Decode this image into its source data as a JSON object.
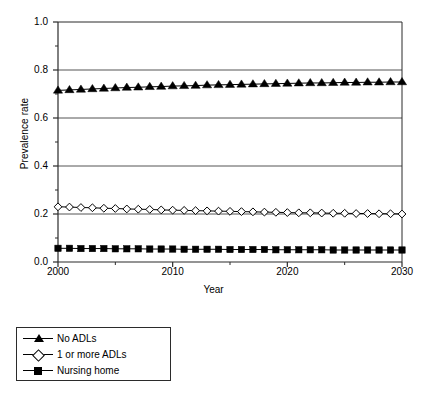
{
  "chart_data": {
    "type": "line",
    "title": "",
    "xlabel": "Year",
    "ylabel": "Prevalence rate",
    "xlim": [
      2000,
      2030
    ],
    "ylim": [
      0.0,
      1.0
    ],
    "grid": "horizontal-major",
    "legend_position": "below-left",
    "x_major_ticks": [
      2000,
      2010,
      2020,
      2030
    ],
    "x_tick_labels": [
      "2000",
      "2010",
      "2020",
      "2030"
    ],
    "x_minor_tick_interval": 5,
    "y_major_ticks": [
      0.0,
      0.2,
      0.4,
      0.6,
      0.8,
      1.0
    ],
    "y_tick_labels": [
      "0.0",
      "0.2",
      "0.4",
      "0.6",
      "0.8",
      "1.0"
    ],
    "y_minor_tick_interval": 0.1,
    "x": [
      2000,
      2001,
      2002,
      2003,
      2004,
      2005,
      2006,
      2007,
      2008,
      2009,
      2010,
      2011,
      2012,
      2013,
      2014,
      2015,
      2016,
      2017,
      2018,
      2019,
      2020,
      2021,
      2022,
      2023,
      2024,
      2025,
      2026,
      2027,
      2028,
      2029,
      2030
    ],
    "series": [
      {
        "name": "No ADLs",
        "marker": "triangle-filled",
        "color": "#000000",
        "values": [
          0.715,
          0.717,
          0.719,
          0.721,
          0.723,
          0.725,
          0.727,
          0.728,
          0.73,
          0.731,
          0.733,
          0.734,
          0.735,
          0.737,
          0.738,
          0.739,
          0.74,
          0.741,
          0.742,
          0.743,
          0.744,
          0.745,
          0.746,
          0.746,
          0.747,
          0.748,
          0.748,
          0.749,
          0.749,
          0.75,
          0.75
        ]
      },
      {
        "name": "1 or more ADLs",
        "marker": "diamond-open",
        "color": "#000000",
        "values": [
          0.23,
          0.229,
          0.227,
          0.226,
          0.224,
          0.223,
          0.221,
          0.22,
          0.219,
          0.217,
          0.216,
          0.215,
          0.214,
          0.213,
          0.212,
          0.211,
          0.21,
          0.209,
          0.208,
          0.207,
          0.206,
          0.205,
          0.205,
          0.204,
          0.203,
          0.203,
          0.202,
          0.202,
          0.201,
          0.201,
          0.2
        ]
      },
      {
        "name": "Nursing home",
        "marker": "square-filled",
        "color": "#000000",
        "values": [
          0.057,
          0.057,
          0.056,
          0.056,
          0.056,
          0.055,
          0.055,
          0.055,
          0.054,
          0.054,
          0.054,
          0.053,
          0.053,
          0.053,
          0.053,
          0.052,
          0.052,
          0.052,
          0.052,
          0.051,
          0.051,
          0.051,
          0.051,
          0.051,
          0.05,
          0.05,
          0.05,
          0.05,
          0.05,
          0.05,
          0.05
        ]
      }
    ]
  },
  "legend": {
    "entries": [
      {
        "label": "No ADLs",
        "marker": "triangle-filled"
      },
      {
        "label": "1 or more ADLs",
        "marker": "diamond-open"
      },
      {
        "label": "Nursing home",
        "marker": "square-filled"
      }
    ]
  },
  "axes": {
    "xlabel": "Year",
    "ylabel": "Prevalence rate"
  },
  "colors": {
    "ink": "#000000",
    "gridline": "#555555",
    "axis": "#2b2b2b",
    "background": "#ffffff"
  }
}
